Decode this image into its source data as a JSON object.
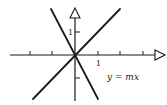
{
  "diagram": {
    "equation_label": "y = mx",
    "x_tick_label": "1",
    "y_tick_label": "1",
    "colors": {
      "ink": "#1a1a1a",
      "background": "#ffffff"
    },
    "axes": {
      "origin": [
        75,
        55
      ],
      "unit_px": 22.5,
      "x_ticks": [
        -2,
        -1,
        1,
        2,
        3
      ],
      "y_ticks": [
        1,
        -1
      ],
      "arrowheads": "open-triangle"
    },
    "lines": [
      {
        "name": "positive-slope-line",
        "slope": 1.0,
        "from": [
          33,
          99
        ],
        "to": [
          120,
          9
        ]
      },
      {
        "name": "negative-slope-line",
        "slope": -1.9,
        "from": [
          51,
          9
        ],
        "to": [
          98,
          99
        ]
      }
    ]
  }
}
